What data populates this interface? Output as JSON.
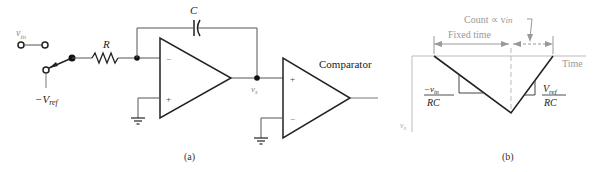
{
  "circuit": {
    "caption": "(a)",
    "labels": {
      "vin": "v",
      "vin_sub": "in",
      "vref": "−V",
      "vref_sub": "ref",
      "resistor": "R",
      "capacitor": "C",
      "vx": "v",
      "vx_sub": "x",
      "comparator": "Comparator",
      "minus": "−",
      "plus": "+"
    }
  },
  "waveform": {
    "caption": "(b)",
    "count_label": "Count ∝ v",
    "count_label_sub": "in",
    "fixed_time_label": "Fixed time",
    "time_axis_label": "Time",
    "y_axis_label": "v",
    "y_axis_sub": "x",
    "slope_left_num": "−v",
    "slope_left_num_sub": "in",
    "slope_left_den": "RC",
    "slope_right_num": "V",
    "slope_right_num_sub": "ref",
    "slope_right_den": "RC"
  },
  "colors": {
    "line": "#222222",
    "grey": "#999999",
    "light": "#bbbbbb"
  }
}
